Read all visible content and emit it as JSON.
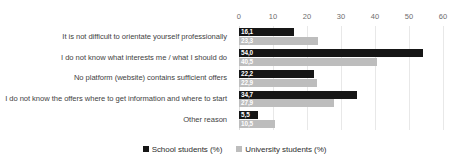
{
  "chart_data": {
    "type": "bar",
    "orientation": "horizontal",
    "title": "",
    "xlabel": "",
    "ylabel": "",
    "xlim": [
      0,
      60
    ],
    "xticks": [
      "0",
      "10",
      "20",
      "30",
      "40",
      "50",
      "60"
    ],
    "grid": true,
    "legend_position": "bottom-center",
    "categories": [
      "It is not difficult to orientate yourself professionally",
      "I do not know what interests me / what I should do",
      "No platform (website) contains sufficient offers",
      "I do not know the offers where to get information and where to start",
      "Other reason"
    ],
    "series": [
      {
        "name": "School students (%)",
        "color": "#161616",
        "values": [
          16.1,
          54.0,
          22.2,
          34.7,
          5.5
        ],
        "labels": [
          "16,1",
          "54,0",
          "22,2",
          "34,7",
          "5,5"
        ]
      },
      {
        "name": "University students (%)",
        "color": "#bdbdbd",
        "values": [
          23.3,
          40.5,
          22.9,
          27.9,
          10.5
        ],
        "labels": [
          "23,3",
          "40,5",
          "22,9",
          "27,9",
          "10,5"
        ]
      }
    ]
  }
}
